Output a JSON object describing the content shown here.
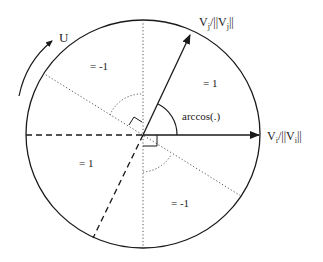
{
  "diagram": {
    "rotation_label": "U",
    "vector_i_label": {
      "base": "V",
      "sub": "i",
      "mid": "/||V",
      "sub2": "i",
      "end": "||"
    },
    "vector_j_label": {
      "base": "V",
      "sub": "j",
      "mid": "/||V",
      "sub2": "j",
      "end": "||"
    },
    "angle_label": "arccos(.)",
    "regions": {
      "upper_left": "= -1",
      "upper_right": "= 1",
      "lower_left": "= 1",
      "lower_right": "= -1"
    },
    "colors": {
      "line": "#1a1a1a",
      "dotted": "#555555",
      "background": "#ffffff"
    }
  }
}
